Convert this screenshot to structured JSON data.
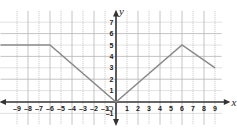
{
  "chart_data": {
    "type": "line",
    "title": "",
    "xlabel": "x",
    "ylabel": "y",
    "xlim": [
      -9,
      9
    ],
    "ylim": [
      -1,
      7
    ],
    "grid": true,
    "x_ticks": [
      "-9",
      "-8",
      "-7",
      "-6",
      "-5",
      "-4",
      "-3",
      "-2",
      "-1",
      "1",
      "2",
      "3",
      "4",
      "5",
      "6",
      "7",
      "8",
      "9"
    ],
    "y_ticks": [
      "-1",
      "1",
      "2",
      "3",
      "4",
      "5",
      "6",
      "7"
    ],
    "origin_label": "O",
    "series": [
      {
        "name": "f(x)",
        "points": [
          [
            -10.5,
            5
          ],
          [
            -6,
            5
          ],
          [
            0,
            0
          ],
          [
            6,
            5
          ],
          [
            9,
            3
          ]
        ],
        "color": "#8a8a8a"
      }
    ]
  }
}
